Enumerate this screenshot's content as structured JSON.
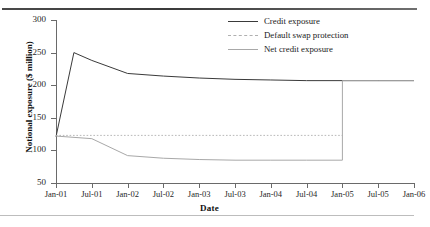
{
  "chart_data": {
    "type": "line",
    "title": "",
    "xlabel": "Date",
    "ylabel": "Notional exposure ($ million)",
    "ylim": [
      50,
      300
    ],
    "yticks": [
      50,
      100,
      150,
      200,
      250,
      300
    ],
    "xticks": [
      "Jan-01",
      "Jul-01",
      "Jan-02",
      "Jul-02",
      "Jan-03",
      "Jul-03",
      "Jan-04",
      "Jul-04",
      "Jan-05",
      "Jul-05",
      "Jan-06"
    ],
    "x_numeric": [
      0,
      0.5,
      1,
      1.5,
      2,
      2.5,
      3,
      3.5,
      4,
      4.5,
      5
    ],
    "grid": false,
    "legend_position": "top-right-inside",
    "series": [
      {
        "name": "Credit exposure",
        "color": "#3a3a3a",
        "style": "solid",
        "x": [
          0,
          0.25,
          0.5,
          1.0,
          1.5,
          2.0,
          2.5,
          3.0,
          3.5,
          4.0,
          4.5,
          5.0
        ],
        "values": [
          121,
          250,
          238,
          218,
          214,
          211,
          209,
          208,
          207,
          207,
          207,
          207
        ]
      },
      {
        "name": "Default swap protection",
        "color": "#b0b0b0",
        "style": "dashed",
        "x": [
          0,
          0.5,
          1.0,
          1.5,
          2.0,
          2.5,
          3.0,
          3.5,
          4.0
        ],
        "values": [
          123,
          123,
          123,
          123,
          123,
          123,
          123,
          123,
          123
        ]
      },
      {
        "name": "Net credit exposure",
        "color": "#a8a8a8",
        "style": "solid",
        "x": [
          0,
          0.5,
          1.0,
          1.5,
          2.0,
          2.5,
          3.0,
          3.5,
          4.0,
          4.0,
          4.5,
          5.0
        ],
        "values": [
          122,
          118,
          92,
          88,
          86,
          85,
          85,
          85,
          85,
          207,
          207,
          207
        ]
      }
    ],
    "annotations": [
      {
        "label": "protection expiry step at Jan-05",
        "x": 4.0,
        "y_from": 85,
        "y_to": 207
      }
    ]
  },
  "legend": {
    "items": [
      {
        "label": "Credit exposure",
        "swatch": "solid-dark-line-icon"
      },
      {
        "label": "Default swap protection",
        "swatch": "dashed-gray-line-icon"
      },
      {
        "label": "Net credit exposure",
        "swatch": "solid-gray-line-icon"
      }
    ]
  }
}
